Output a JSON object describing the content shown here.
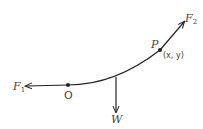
{
  "diagram": {
    "labels": {
      "f1": "F",
      "f1_sub": "1",
      "f2": "F",
      "f2_sub": "2",
      "origin": "O",
      "point": "P",
      "point_coords": "(x, y)",
      "weight": "W"
    },
    "colors": {
      "line": "#222222",
      "text": "#444444",
      "background": "#ffffff"
    }
  }
}
